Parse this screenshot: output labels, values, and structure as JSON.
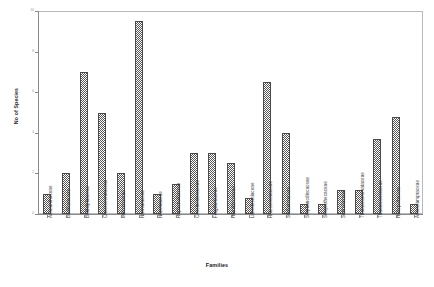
{
  "chart_data": {
    "type": "bar",
    "title": "",
    "xlabel": "Families",
    "ylabel": "No of Species",
    "ylim": [
      0,
      10
    ],
    "ytick_values": [
      0,
      2,
      4,
      6,
      8,
      10
    ],
    "ytick_labels": [
      "0",
      "2",
      "4",
      "6",
      "8",
      "10"
    ],
    "grid": false,
    "legend": null,
    "bar_fill": "hatched-checker-gray",
    "bar_edge_color": "#4a4a4a",
    "categories": [
      "Achnanthaceae",
      "Bacillariaceae",
      "Biddulphiaceae",
      "Chaetocerataceae",
      "Melosiraceae",
      "Naviculaceae",
      "Nitzchiaceae",
      "Raphoneidaceae",
      "Coscinodiscaceae",
      "Fragillariaceae",
      "Hemidiscaceae",
      "Lithodesmiaceae",
      "Rhizosoleniaceae",
      "Stellarimaceae",
      "Stephanodiscaceae",
      "Streptothecaceae",
      "Surirellaceae",
      "Thalassionemataceae",
      "Thalassiosiraceae",
      "Heliopeltaceae",
      "Asterolampraceae"
    ],
    "values": [
      1,
      2,
      7,
      5,
      2,
      9.5,
      1,
      1.5,
      3,
      3,
      2.5,
      0.8,
      6.5,
      4,
      0.5,
      0.5,
      1.2,
      1.2,
      3.7,
      4.8,
      0.5
    ]
  }
}
